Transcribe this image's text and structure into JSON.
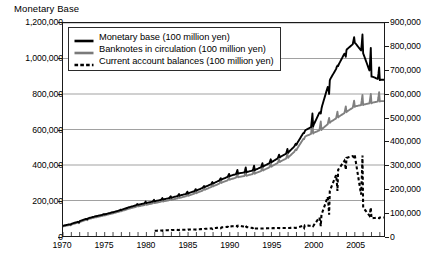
{
  "chart_title": "Monetary Base",
  "axes": {
    "left_ticks": [
      "0",
      "200,000",
      "400,000",
      "600,000",
      "800,000",
      "1,000,000",
      "1,200,000"
    ],
    "right_ticks": [
      "0",
      "100,000",
      "200,000",
      "300,000",
      "400,000",
      "500,000",
      "600,000",
      "700,000",
      "800,000",
      "900,000"
    ],
    "x_labels": [
      "1970",
      "1975",
      "1980",
      "1985",
      "1990",
      "1995",
      "2000",
      "2005"
    ]
  },
  "legend": {
    "items": [
      {
        "label": "Monetary base (100 million yen)",
        "style": "solid-thick",
        "color": "#000000"
      },
      {
        "label": "Banknotes in circulation (100 million yen)",
        "style": "solid-thick",
        "color": "#7a7a7a"
      },
      {
        "label": "Current account balances (100 million yen)",
        "style": "dashed-thick",
        "color": "#000000"
      }
    ]
  },
  "colors": {
    "monetary_base": "#000000",
    "banknotes": "#808080",
    "current_account": "#000000",
    "gridline": "#888888",
    "axis": "#1a1a1a"
  },
  "chart_data": {
    "type": "line",
    "title": "Monetary Base",
    "xlabel": "",
    "ylabel": "",
    "xlim": [
      1970,
      2008.5
    ],
    "ylim": [
      0,
      1200000
    ],
    "ylim_right": [
      0,
      900000
    ],
    "grid": true,
    "legend_position": "top-left",
    "note": "Monthly data with strong December seasonal spikes. Monetary base and banknotes plotted on left axis (0-1,200,000); current account balances read against right axis (0-900,000). Values below are annual averages in 100 million yen, with december_spike giving the seasonal peak of the monetary base.",
    "x": [
      1970,
      1971,
      1972,
      1973,
      1974,
      1975,
      1976,
      1977,
      1978,
      1979,
      1980,
      1981,
      1982,
      1983,
      1984,
      1985,
      1986,
      1987,
      1988,
      1989,
      1990,
      1991,
      1992,
      1993,
      1994,
      1995,
      1996,
      1997,
      1998,
      1999,
      2000,
      2001,
      2002,
      2003,
      2004,
      2005,
      2006,
      2007,
      2008
    ],
    "series": [
      {
        "name": "Monetary base (100 million yen)",
        "axis": "left",
        "color": "#000000",
        "values": [
          58000,
          68000,
          84000,
          100000,
          112000,
          122000,
          134000,
          147000,
          163000,
          176000,
          186000,
          196000,
          206000,
          216000,
          228000,
          240000,
          256000,
          276000,
          296000,
          318000,
          338000,
          352000,
          360000,
          372000,
          392000,
          416000,
          444000,
          470000,
          516000,
          594000,
          620000,
          720000,
          880000,
          960000,
          1050000,
          1090000,
          1030000,
          900000,
          880000
        ],
        "december_spike": [
          64000,
          76000,
          94000,
          112000,
          124000,
          134000,
          148000,
          162000,
          180000,
          194000,
          204000,
          214000,
          224000,
          236000,
          250000,
          264000,
          282000,
          304000,
          326000,
          350000,
          372000,
          386000,
          396000,
          410000,
          432000,
          458000,
          490000,
          520000,
          580000,
          690000,
          690000,
          800000,
          960000,
          1010000,
          1120000,
          1135000,
          1060000,
          950000,
          920000
        ]
      },
      {
        "name": "Banknotes in circulation (100 million yen)",
        "axis": "left",
        "color": "#808080",
        "values": [
          54000,
          64000,
          79000,
          95000,
          106000,
          116000,
          128000,
          140000,
          155000,
          167000,
          176000,
          186000,
          195000,
          204000,
          215000,
          227000,
          242000,
          261000,
          280000,
          300000,
          318000,
          332000,
          340000,
          352000,
          370000,
          392000,
          418000,
          442000,
          486000,
          560000,
          580000,
          600000,
          640000,
          670000,
          700000,
          730000,
          740000,
          750000,
          760000
        ],
        "december_spike": [
          60000,
          72000,
          89000,
          106000,
          118000,
          127000,
          141000,
          154000,
          171000,
          184000,
          193000,
          203000,
          212000,
          223000,
          236000,
          249000,
          266000,
          287000,
          308000,
          330000,
          350000,
          364000,
          373000,
          386000,
          406000,
          430000,
          460000,
          488000,
          546000,
          650000,
          645000,
          665000,
          700000,
          730000,
          762000,
          795000,
          800000,
          810000,
          820000
        ]
      },
      {
        "name": "Current account balances (100 million yen)",
        "axis": "right",
        "color": "#000000",
        "values": [
          null,
          null,
          null,
          null,
          null,
          null,
          null,
          null,
          null,
          null,
          null,
          22000,
          24000,
          25000,
          26000,
          27000,
          28000,
          30000,
          33000,
          36000,
          40000,
          44000,
          38000,
          32000,
          32000,
          33000,
          34000,
          34000,
          35000,
          45000,
          42000,
          90000,
          190000,
          280000,
          330000,
          340000,
          120000,
          75000,
          78000
        ]
      }
    ]
  }
}
